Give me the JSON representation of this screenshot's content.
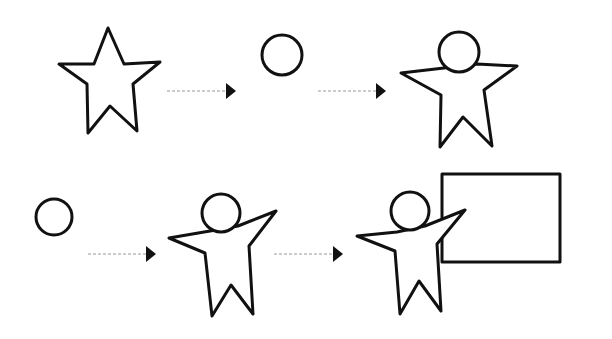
{
  "diagram": {
    "rows": [
      {
        "steps": [
          {
            "shape": "star",
            "name": "star"
          },
          {
            "connector": "dotted-arrow"
          },
          {
            "shape": "circle",
            "name": "head-circle"
          },
          {
            "connector": "dotted-arrow"
          },
          {
            "shape": "star-figure",
            "name": "star-with-head"
          }
        ]
      },
      {
        "steps": [
          {
            "shape": "circle",
            "name": "head-circle"
          },
          {
            "connector": "dotted-arrow"
          },
          {
            "shape": "person-figure",
            "name": "person-arms-raised"
          },
          {
            "connector": "dotted-arrow"
          },
          {
            "shape": "person-with-board",
            "name": "person-presenting-board"
          }
        ]
      }
    ],
    "colors": {
      "ink": "#111111",
      "connector": "#9a9a9a",
      "background": "#ffffff"
    }
  }
}
